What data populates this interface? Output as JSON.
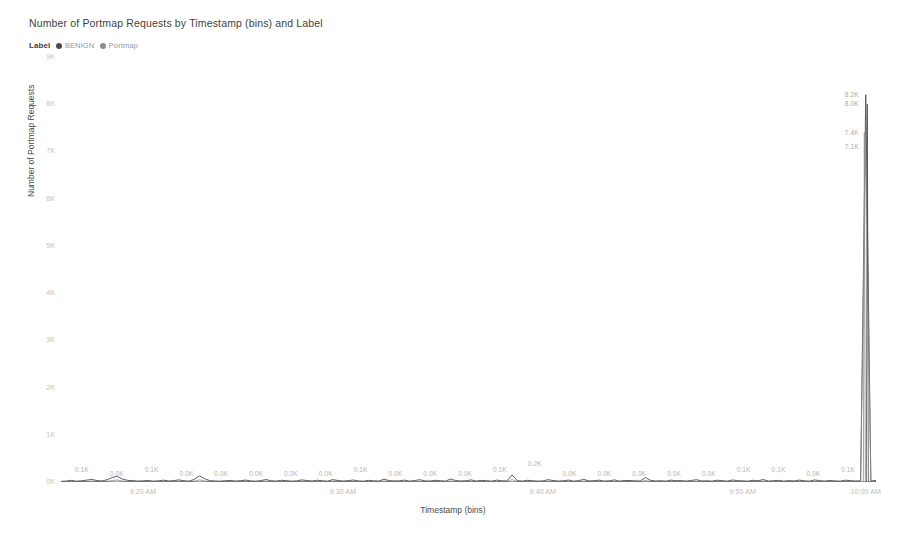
{
  "chart_data": {
    "type": "line",
    "title": "Number of Portmap Requests by Timestamp (bins) and Label",
    "xlabel": "Timestamp (bins)",
    "ylabel": "Number of Portmap Requests",
    "ylim": [
      0,
      9000
    ],
    "yticks": [
      "0K",
      "1K",
      "2K",
      "3K",
      "4K",
      "5K",
      "6K",
      "7K",
      "8K",
      "9K"
    ],
    "ytick_values": [
      0,
      1000,
      2000,
      3000,
      4000,
      5000,
      6000,
      7000,
      8000,
      9000
    ],
    "xticks": [
      "9:20 AM",
      "9:30 AM",
      "9:40 AM",
      "9:50 AM",
      "10:00 AM"
    ],
    "xtick_values": [
      "9:20",
      "9:30",
      "9:40",
      "9:50",
      "10:00"
    ],
    "grid": false,
    "legend_position": "top-left",
    "legend_title": "Label",
    "series": [
      {
        "name": "BENIGN",
        "color": "#4c4c4c",
        "values": [
          12,
          20,
          35,
          18,
          26,
          40,
          55,
          30,
          22,
          48,
          95,
          120,
          60,
          35,
          28,
          20,
          24,
          32,
          18,
          26,
          38,
          22,
          30,
          44,
          26,
          18,
          55,
          130,
          70,
          30,
          22,
          18,
          26,
          34,
          20,
          28,
          40,
          24,
          18,
          30,
          52,
          26,
          20,
          36,
          28,
          18,
          24,
          44,
          30,
          22,
          38,
          26,
          18,
          50,
          32,
          20,
          28,
          42,
          24,
          18,
          34,
          26,
          20,
          58,
          30,
          22,
          26,
          40,
          18,
          32,
          48,
          24,
          20,
          36,
          28,
          18,
          62,
          30,
          22,
          26,
          44,
          20,
          34,
          28,
          18,
          40,
          26,
          22,
          150,
          30,
          20,
          36,
          28,
          18,
          24,
          48,
          32,
          20,
          26,
          40,
          18,
          30,
          54,
          22,
          28,
          38,
          20,
          26,
          44,
          18,
          32,
          30,
          24,
          20,
          95,
          36,
          22,
          28,
          18,
          40,
          26,
          30,
          20,
          34,
          48,
          22,
          26,
          18,
          38,
          28,
          20,
          42,
          30,
          24,
          18,
          36,
          26,
          52,
          20,
          28,
          34,
          18,
          30,
          22,
          40,
          26,
          18,
          44,
          28,
          20,
          32,
          24,
          18,
          38,
          30,
          22,
          26,
          48,
          20,
          34
        ]
      },
      {
        "name": "Portmap",
        "color": "#8c8c8c",
        "values": [
          5,
          8,
          12,
          6,
          10,
          14,
          18,
          10,
          8,
          16,
          30,
          42,
          20,
          12,
          10,
          7,
          9,
          11,
          6,
          9,
          13,
          8,
          10,
          15,
          9,
          6,
          18,
          45,
          24,
          10,
          8,
          6,
          9,
          12,
          7,
          10,
          14,
          8,
          6,
          10,
          18,
          9,
          7,
          12,
          10,
          6,
          8,
          15,
          10,
          8,
          13,
          9,
          6,
          17,
          11,
          7,
          10,
          14,
          8,
          6,
          12,
          9,
          7,
          20,
          10,
          8,
          9,
          14,
          6,
          11,
          16,
          8,
          7,
          12,
          10,
          6,
          21,
          10,
          8,
          9,
          15,
          7,
          12,
          10,
          6,
          14,
          9,
          8,
          50,
          10,
          7,
          12,
          10,
          6,
          8,
          16,
          11,
          7,
          9,
          14,
          6,
          10,
          18,
          8,
          10,
          13,
          7,
          9,
          15,
          6,
          11,
          10,
          8,
          7,
          32,
          12,
          8,
          10,
          6,
          14,
          9,
          10,
          7,
          12,
          16,
          8,
          9,
          6,
          13,
          10,
          7,
          14,
          10,
          8,
          6,
          12,
          9,
          18,
          7,
          10,
          12,
          6,
          10,
          8,
          14,
          9,
          6,
          15,
          10,
          7,
          11,
          8,
          6,
          13,
          10,
          8,
          9,
          16,
          7,
          12
        ]
      }
    ],
    "peak": {
      "x_position": "10:00 AM",
      "labels": [
        "8.2K",
        "8.0K",
        "7.4K",
        "7.1K"
      ],
      "values": [
        8200,
        8000,
        7400,
        7100
      ]
    },
    "baseline_labels": [
      {
        "x": "9:21 AM",
        "text": "0.1K"
      },
      {
        "x": "9:25 AM",
        "text": "0.0K"
      },
      {
        "x": "9:28 AM",
        "text": "0.1K"
      },
      {
        "x": "9:32 AM",
        "text": "0.0K"
      },
      {
        "x": "9:35 AM",
        "text": "0.0K"
      },
      {
        "x": "9:37 AM",
        "text": "0.0K"
      },
      {
        "x": "9:39 AM",
        "text": "0.0K"
      },
      {
        "x": "9:41 AM",
        "text": "0.0K"
      },
      {
        "x": "9:42 AM",
        "text": "0.1K"
      },
      {
        "x": "9:44 AM",
        "text": "0.0K"
      },
      {
        "x": "9:46 AM",
        "text": "0.0K"
      },
      {
        "x": "9:48 AM",
        "text": "0.0K"
      },
      {
        "x": "9:50 AM",
        "text": "0.1K"
      },
      {
        "x": "9:52 AM",
        "text": "0.2K"
      },
      {
        "x": "9:53 AM",
        "text": "0.0K"
      },
      {
        "x": "9:55 AM",
        "text": "0.0K"
      },
      {
        "x": "9:56 AM",
        "text": "0.0K"
      },
      {
        "x": "9:57 AM",
        "text": "0.0K"
      },
      {
        "x": "9:59 AM",
        "text": "0.0K"
      },
      {
        "x": "10:00 AM",
        "text": "0.1K"
      },
      {
        "x": "10:01 AM",
        "text": "0.1K"
      },
      {
        "x": "10:02 AM",
        "text": "0.0K"
      },
      {
        "x": "10:03 AM",
        "text": "0.1K"
      }
    ]
  },
  "legend": {
    "title": "Label",
    "items": [
      {
        "label": "BENIGN",
        "color": "#4c4c4c"
      },
      {
        "label": "Portmap",
        "color": "#8c8c8c"
      }
    ]
  }
}
